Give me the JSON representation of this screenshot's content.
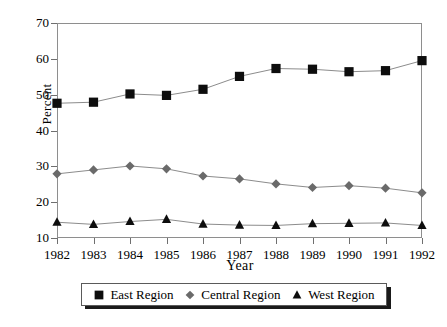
{
  "chart_data": {
    "type": "line",
    "title": "",
    "xlabel": "Year",
    "ylabel": "Percent",
    "categories": [
      "1982",
      "1983",
      "1984",
      "1985",
      "1986",
      "1987",
      "1988",
      "1989",
      "1990",
      "1991",
      "1992"
    ],
    "x": [
      1982,
      1983,
      1984,
      1985,
      1986,
      1987,
      1988,
      1989,
      1990,
      1991,
      1992
    ],
    "xlim": [
      1982,
      1992
    ],
    "ylim": [
      10,
      70
    ],
    "yticks": [
      10,
      20,
      30,
      40,
      50,
      60,
      70
    ],
    "ytick_labels": [
      "10",
      "20",
      "30",
      "40",
      "50",
      "60",
      "70"
    ],
    "xticks": [
      1982,
      1983,
      1984,
      1985,
      1986,
      1987,
      1988,
      1989,
      1990,
      1991,
      1992
    ],
    "grid": false,
    "legend_position": "bottom",
    "series": [
      {
        "name": "East Region",
        "marker": "square",
        "color": "#0d0d0d",
        "line_color": "#8c8c8c",
        "values": [
          47.6,
          47.9,
          50.2,
          49.8,
          51.5,
          55.1,
          57.3,
          57.1,
          56.4,
          56.7,
          59.5
        ]
      },
      {
        "name": "Central Region",
        "marker": "diamond",
        "color": "#6a6a6a",
        "line_color": "#8c8c8c",
        "values": [
          27.9,
          29.0,
          30.1,
          29.3,
          27.3,
          26.5,
          25.1,
          24.1,
          24.6,
          23.9,
          22.6
        ]
      },
      {
        "name": "West Region",
        "marker": "triangle",
        "color": "#0d0d0d",
        "line_color": "#8c8c8c",
        "values": [
          14.4,
          13.8,
          14.6,
          15.2,
          13.9,
          13.6,
          13.5,
          14.0,
          14.1,
          14.2,
          13.5
        ]
      }
    ]
  },
  "axes": {
    "y_title": "Percent",
    "x_title": "Year"
  },
  "legend": {
    "items": [
      {
        "label": "East Region",
        "marker": "square-marker",
        "color": "#0d0d0d"
      },
      {
        "label": "Central Region",
        "marker": "diamond-marker",
        "color": "#6a6a6a"
      },
      {
        "label": "West Region",
        "marker": "triangle-marker",
        "color": "#0d0d0d"
      }
    ]
  }
}
